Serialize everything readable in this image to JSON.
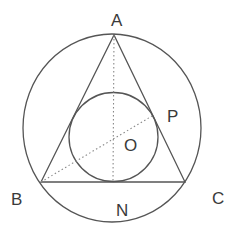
{
  "diagram": {
    "type": "geometry",
    "colors": {
      "line": "#555555",
      "dotted": "#888888",
      "label": "#3a3a3a",
      "background": "#ffffff"
    },
    "labels": {
      "A": "A",
      "B": "B",
      "C": "C",
      "N": "N",
      "O": "O",
      "P": "P"
    },
    "points": {
      "A": [
        114,
        35
      ],
      "B": [
        41,
        182
      ],
      "C": [
        185,
        182
      ],
      "N": [
        113,
        182
      ],
      "P": [
        152,
        116
      ],
      "O": [
        113,
        137
      ]
    },
    "circumcircle": {
      "cx": 112,
      "cy": 128,
      "rx": 89,
      "ry": 94
    },
    "incircle": {
      "cx": 113.5,
      "cy": 137,
      "r": 44.5
    },
    "segments": {
      "solid": [
        [
          "A",
          "B"
        ],
        [
          "B",
          "C"
        ],
        [
          "C",
          "A"
        ]
      ],
      "dotted": [
        [
          "A",
          "N"
        ],
        [
          "B",
          "P"
        ]
      ]
    }
  }
}
